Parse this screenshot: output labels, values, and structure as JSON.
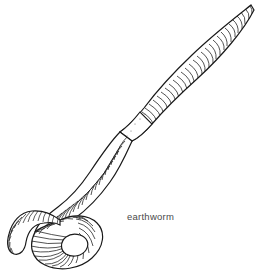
{
  "figure": {
    "title": "earthworm",
    "caption": "earthworm",
    "caption_color": "#4a4a4a",
    "background_color": "#ffffff",
    "ink_color": "#1a1a1a",
    "fill_color": "#ffffff",
    "width": 259,
    "height": 270,
    "style": "black-and-white line drawing / scientific illustration",
    "subject": "earthworm",
    "border": "none"
  },
  "anatomy": {
    "parts": [
      {
        "name": "tail",
        "label": "tail tip",
        "description": "tapered pointed posterior end at upper right",
        "tip_x": 252,
        "tip_y": 4
      },
      {
        "name": "body",
        "label": "segmented body",
        "description": "long cylindrical body with dense annuli running diagonally from upper right to lower left",
        "segment_rings": 150
      },
      {
        "name": "clitellum",
        "label": "clitellum",
        "description": "smooth unsegmented saddle band in middle of body",
        "x": 130,
        "y": 100,
        "width": 32,
        "height": 32
      },
      {
        "name": "loop",
        "label": "coiled loop",
        "description": "body crosses over itself forming a ring with open white centre at lower left",
        "x": 55,
        "y": 225,
        "width": 50,
        "height": 43
      },
      {
        "name": "head",
        "label": "head end",
        "description": "anterior end emerging from loop, arcing to the far left and tapering to a rounded tip",
        "tip_x": 8,
        "tip_y": 241
      }
    ]
  }
}
